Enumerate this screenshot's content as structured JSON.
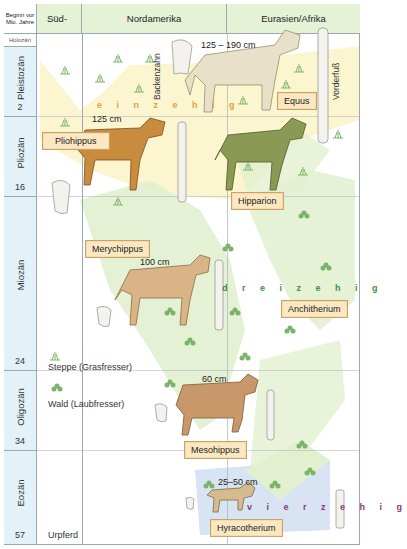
{
  "header": {
    "time_col": "Beginn vor Mio. Jahre",
    "columns": [
      "Süd-",
      "Nordamerika",
      "Eurasien/Afrika"
    ],
    "holocene": "Holozän"
  },
  "periods": [
    {
      "name": "Pleistozän",
      "start": "2"
    },
    {
      "name": "Pliozän",
      "start": "16"
    },
    {
      "name": "Miozän",
      "start": "24"
    },
    {
      "name": "Oligozän",
      "start": "34"
    },
    {
      "name": "Eozän",
      "start": "57"
    }
  ],
  "species": [
    {
      "name": "Equus",
      "size": "125 – 190 cm"
    },
    {
      "name": "Pliohippus",
      "size": "125 cm"
    },
    {
      "name": "Hipparion",
      "size": ""
    },
    {
      "name": "Merychippus",
      "size": "100 cm"
    },
    {
      "name": "Anchitherium",
      "size": ""
    },
    {
      "name": "Mesohippus",
      "size": "60 cm"
    },
    {
      "name": "Hyracotherium",
      "size": "25–50 cm"
    }
  ],
  "toe_labels": {
    "one": "e i n z e h i g",
    "three": "d r e i z e h i g",
    "four": "v i e r z e h i g"
  },
  "annotations": {
    "molar": "Backenzahn",
    "forefoot": "Vorderfuß",
    "steppe": "Steppe (Grasfresser)",
    "forest": "Wald (Laubfresser)",
    "ancestral": "Urpferd"
  },
  "colors": {
    "header_green": "#e6f2d6",
    "period_blue": "#e3f1f8",
    "steppe_yellow": "#fbf6cf",
    "forest_green": "#e2f0cf",
    "eocene_blue": "#d8e3f3",
    "label_fill": "#fbe8c2",
    "one_toe": "#e8a040",
    "three_toe": "#3f8f3f",
    "four_toe": "#8a3a7a"
  }
}
